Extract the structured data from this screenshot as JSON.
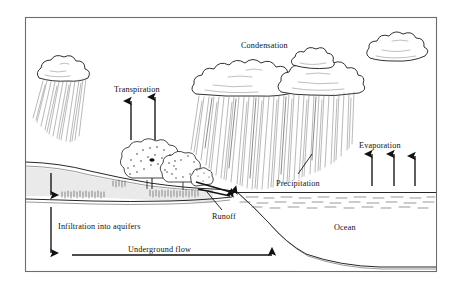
{
  "diagram": {
    "background_color": "#ffffff",
    "ink_color": "#1a1a1a",
    "frame_color": "#6d6d6d",
    "labels": {
      "condensation": "Condensation",
      "transpiration": "Transpiration",
      "evaporation": "Evaporation",
      "precipitation": "Precipitation",
      "runoff": "Runoff",
      "infiltration": "Infiltration into aquifers",
      "underground_flow": "Underground flow",
      "ocean": "Ocean"
    },
    "elements": {
      "cloud_left": "rain-cloud-left",
      "cloud_center": "rain-cloud-bank-center",
      "cloud_right": "cloud-top-right",
      "trees": "tree-cluster",
      "hill": "hillside-terrain",
      "water_table": "water-table-line",
      "ocean_body": "ocean",
      "seafloor": "ocean-floor"
    },
    "arrows": {
      "transpiration_count": 2,
      "evaporation_count": 3,
      "infiltration_count": 2,
      "underground_flow_direction": "right",
      "runoff_direction": "down-right"
    }
  }
}
